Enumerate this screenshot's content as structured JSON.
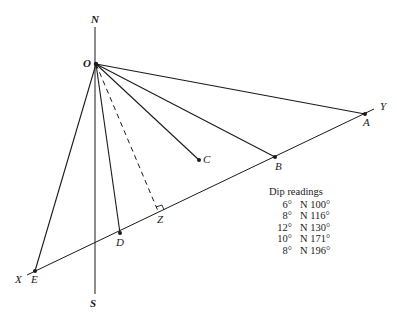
{
  "diagram": {
    "labels": {
      "north": "N",
      "south": "S",
      "origin": "O",
      "x_end": "X",
      "y_end": "Y",
      "point_a": "A",
      "point_b": "B",
      "point_c": "C",
      "point_d": "D",
      "point_e": "E",
      "point_z": "Z"
    },
    "line_color": "#1a1a1a",
    "dip_readings": {
      "title": "Dip readings",
      "rows": [
        {
          "dip": "6°",
          "direction": "N 100°"
        },
        {
          "dip": "8°",
          "direction": "N 116°"
        },
        {
          "dip": "12°",
          "direction": "N 130°"
        },
        {
          "dip": "10°",
          "direction": "N 171°"
        },
        {
          "dip": "8°",
          "direction": "N 196°"
        }
      ]
    }
  }
}
